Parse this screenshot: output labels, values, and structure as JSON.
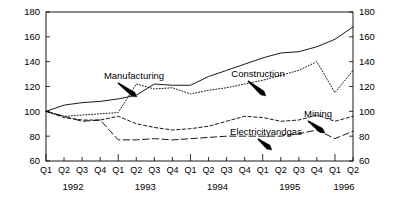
{
  "chart_data": {
    "type": "line",
    "title": "",
    "xlabel": "",
    "ylabel": "",
    "ylim": [
      60,
      180
    ],
    "yticks": [
      60,
      80,
      100,
      120,
      140,
      160,
      180
    ],
    "grid": false,
    "legend_position": "inline-annotations",
    "dual_y_axis": true,
    "x": [
      "Q1",
      "Q2",
      "Q3",
      "Q4",
      "Q1",
      "Q2",
      "Q3",
      "Q4",
      "Q1",
      "Q2",
      "Q3",
      "Q4",
      "Q1",
      "Q2",
      "Q3",
      "Q4",
      "Q1",
      "Q2"
    ],
    "year_groups": [
      {
        "label": "1992",
        "quarters": [
          "Q1",
          "Q2",
          "Q3",
          "Q4"
        ]
      },
      {
        "label": "1993",
        "quarters": [
          "Q1",
          "Q2",
          "Q3",
          "Q4"
        ]
      },
      {
        "label": "1994",
        "quarters": [
          "Q1",
          "Q2",
          "Q3",
          "Q4"
        ]
      },
      {
        "label": "1995",
        "quarters": [
          "Q1",
          "Q2",
          "Q3",
          "Q4"
        ]
      },
      {
        "label": "1996",
        "quarters": [
          "Q1",
          "Q2"
        ]
      }
    ],
    "series": [
      {
        "name": "Construction",
        "style": "solid",
        "values": [
          100,
          105,
          107,
          108,
          110,
          113,
          122,
          121,
          121,
          128,
          133,
          138,
          143,
          147,
          148,
          152,
          158,
          168
        ]
      },
      {
        "name": "Manufacturing",
        "style": "dotted",
        "values": [
          100,
          96,
          97,
          98,
          99,
          122,
          118,
          119,
          114,
          117,
          119,
          122,
          125,
          129,
          133,
          140,
          115,
          133
        ]
      },
      {
        "name": "Mining",
        "style": "short-dash",
        "values": [
          100,
          95,
          93,
          93,
          96,
          90,
          87,
          85,
          86,
          88,
          92,
          96,
          95,
          92,
          93,
          97,
          92,
          96
        ]
      },
      {
        "name": "Electricityandgas",
        "style": "long-dash",
        "values": [
          100,
          96,
          92,
          93,
          77,
          77,
          78,
          77,
          78,
          79,
          80,
          80,
          80,
          80,
          82,
          85,
          78,
          84
        ]
      }
    ],
    "annotations": [
      {
        "label": "Manufacturing",
        "target_series": "Manufacturing"
      },
      {
        "label": "Construction",
        "target_series": "Construction"
      },
      {
        "label": "Mining",
        "target_series": "Mining"
      },
      {
        "label": "Electricityandgas",
        "target_series": "Electricityandgas"
      }
    ]
  },
  "axis": {
    "left_ticks": [
      "180",
      "160",
      "140",
      "120",
      "100",
      "80",
      "60"
    ],
    "right_ticks": [
      "180",
      "160",
      "140",
      "120",
      "100",
      "80",
      "60"
    ]
  }
}
